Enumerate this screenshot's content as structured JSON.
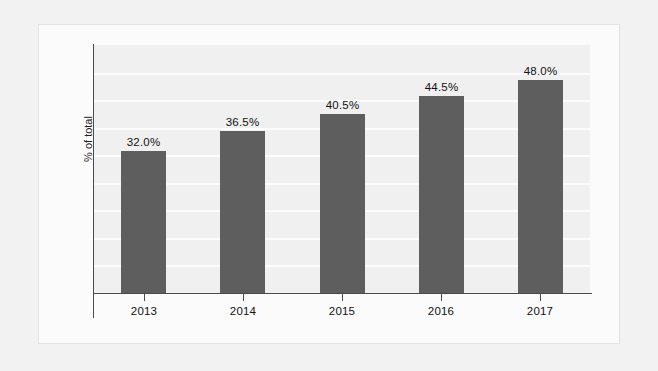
{
  "chart_data": {
    "type": "bar",
    "title": "",
    "subtitle": "",
    "xlabel": "",
    "ylabel": "% of total",
    "categories": [
      "2013",
      "2014",
      "2015",
      "2016",
      "2017"
    ],
    "values": [
      32.0,
      36.5,
      40.5,
      44.5,
      48.0
    ],
    "value_labels": [
      "32.0%",
      "36.5%",
      "40.5%",
      "44.5%",
      "48.0%"
    ],
    "series": [
      {
        "name": "% of total",
        "values": [
          32.0,
          36.5,
          40.5,
          44.5,
          48.0
        ]
      }
    ],
    "ylim": [
      0,
      56
    ],
    "y_tick_labels": [],
    "grid": true,
    "grid_orientation": "horizontal",
    "grid_line_count": 8,
    "legend": false,
    "legend_position": "none",
    "bar_color": "#5e5e5e",
    "plot_background": "#f0f0f0",
    "gridline_color": "#fcfcfc",
    "axis_color": "#4a4a4a",
    "label_color": "#111111",
    "card_background": "#fbfbfb",
    "page_background": "#f2f2f2"
  }
}
